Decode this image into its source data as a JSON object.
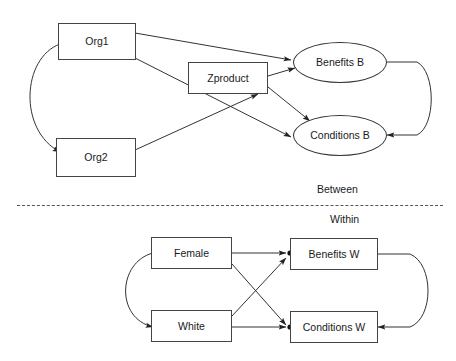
{
  "diagram": {
    "sections": [
      {
        "id": "between",
        "label": "Between"
      },
      {
        "id": "within",
        "label": "Within"
      }
    ],
    "between": {
      "nodes": [
        {
          "id": "org1",
          "label": "Org1",
          "shape": "rectangle"
        },
        {
          "id": "org2",
          "label": "Org2",
          "shape": "rectangle"
        },
        {
          "id": "zproduct",
          "label": "Zproduct",
          "shape": "rectangle"
        },
        {
          "id": "benefits_b",
          "label": "Benefits  B",
          "shape": "ellipse"
        },
        {
          "id": "conditions_b",
          "label": "Conditions B",
          "shape": "ellipse"
        }
      ],
      "edges": [
        {
          "from": "org1",
          "to": "benefits_b",
          "type": "directed"
        },
        {
          "from": "org1",
          "to": "conditions_b",
          "type": "directed"
        },
        {
          "from": "org2",
          "to": "zproduct",
          "type": "directed"
        },
        {
          "from": "zproduct",
          "to": "benefits_b",
          "type": "directed"
        },
        {
          "from": "zproduct",
          "to": "conditions_b",
          "type": "directed"
        },
        {
          "from": "org1",
          "to": "org2",
          "type": "bidirectional-curve"
        },
        {
          "from": "benefits_b",
          "to": "conditions_b",
          "type": "bidirectional-curve"
        }
      ]
    },
    "within": {
      "nodes": [
        {
          "id": "female",
          "label": "Female",
          "shape": "rectangle"
        },
        {
          "id": "white",
          "label": "White",
          "shape": "rectangle"
        },
        {
          "id": "benefits_w",
          "label": "Benefits W",
          "shape": "rectangle"
        },
        {
          "id": "conditions_w",
          "label": "Conditions W",
          "shape": "rectangle"
        }
      ],
      "edges": [
        {
          "from": "female",
          "to": "benefits_w",
          "type": "directed"
        },
        {
          "from": "female",
          "to": "conditions_w",
          "type": "directed"
        },
        {
          "from": "white",
          "to": "benefits_w",
          "type": "directed"
        },
        {
          "from": "white",
          "to": "conditions_w",
          "type": "directed"
        },
        {
          "from": "female",
          "to": "white",
          "type": "bidirectional-curve"
        },
        {
          "from": "benefits_w",
          "to": "conditions_w",
          "type": "bidirectional-curve"
        }
      ],
      "residual_markers": [
        {
          "on": "benefits_w"
        },
        {
          "on": "conditions_w"
        }
      ]
    },
    "colors": {
      "background": "#ffffff",
      "stroke": "#333333",
      "box_border": "#444444",
      "text": "#1a1a1a",
      "divider": "#555555"
    }
  }
}
